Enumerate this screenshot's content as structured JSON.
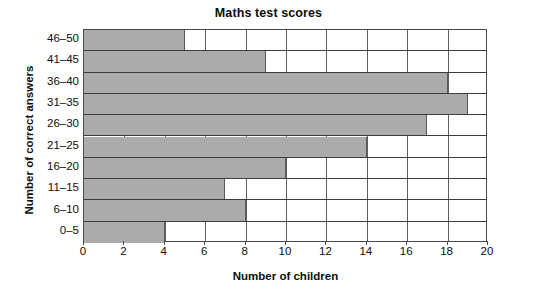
{
  "chart_data": {
    "type": "bar",
    "orientation": "horizontal",
    "title": "Maths test scores",
    "xlabel": "Number of children",
    "ylabel": "Number of correct answers",
    "categories": [
      "0–5",
      "6–10",
      "11–15",
      "16–20",
      "21–25",
      "26–30",
      "31–35",
      "36–40",
      "41–45",
      "46–50"
    ],
    "values": [
      4,
      8,
      7,
      10,
      14,
      17,
      19,
      18,
      9,
      5
    ],
    "xlim": [
      0,
      20
    ],
    "xticks": [
      0,
      2,
      4,
      6,
      8,
      10,
      12,
      14,
      16,
      18,
      20
    ],
    "xtick_labels": [
      "0",
      "2",
      "4",
      "6",
      "8",
      "10",
      "12",
      "14",
      "16",
      "18",
      "20"
    ],
    "grid": true,
    "grid_axis": "x",
    "legend": false,
    "bar_color": "#ababab",
    "bar_edge_color": "#5a5a5a",
    "axis_color": "#4a4a4a",
    "grid_color": "#606060",
    "background_color": "#ffffff",
    "text_color": "#0d0d0d"
  }
}
